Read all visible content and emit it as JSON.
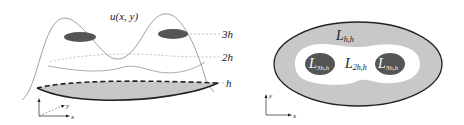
{
  "left_panel": {
    "surface_label": "u(x, y)",
    "levels": [
      {
        "label": "3h"
      },
      {
        "label": "2h"
      },
      {
        "label": "h"
      }
    ],
    "axes": {
      "x": "x",
      "y": "y"
    }
  },
  "right_panel": {
    "regions": [
      {
        "main": "L",
        "sub": "h,h"
      },
      {
        "main": "L",
        "sub": "2h,h"
      },
      {
        "main": "L",
        "sub": "3h,h"
      },
      {
        "main": "L",
        "sub": "3h,h"
      }
    ],
    "axes": {
      "x": "x",
      "y": "y"
    }
  },
  "colors": {
    "dark_fill": "#555555",
    "light_fill": "#c8c8c8",
    "line": "#222222",
    "thin_line": "#888888",
    "white_text": "#ffffff"
  }
}
